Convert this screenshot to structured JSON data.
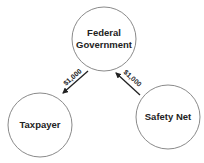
{
  "diagram": {
    "nodes": [
      {
        "id": "federal",
        "label_lines": [
          "Federal",
          "Government"
        ],
        "cx": 104,
        "cy": 39,
        "r": 32
      },
      {
        "id": "taxpayer",
        "label_lines": [
          "Taxpayer"
        ],
        "cx": 40,
        "cy": 125,
        "r": 32
      },
      {
        "id": "safety_net",
        "label_lines": [
          "Safety Net"
        ],
        "cx": 168,
        "cy": 117,
        "r": 32
      }
    ],
    "edges": [
      {
        "from": "federal",
        "to": "taxpayer",
        "label": "$1,000"
      },
      {
        "from": "safety_net",
        "to": "federal",
        "label": "$1,000"
      }
    ],
    "colors": {
      "circle_stroke": "#8a8a8a",
      "arrow": "#222222",
      "text": "#222222"
    }
  }
}
